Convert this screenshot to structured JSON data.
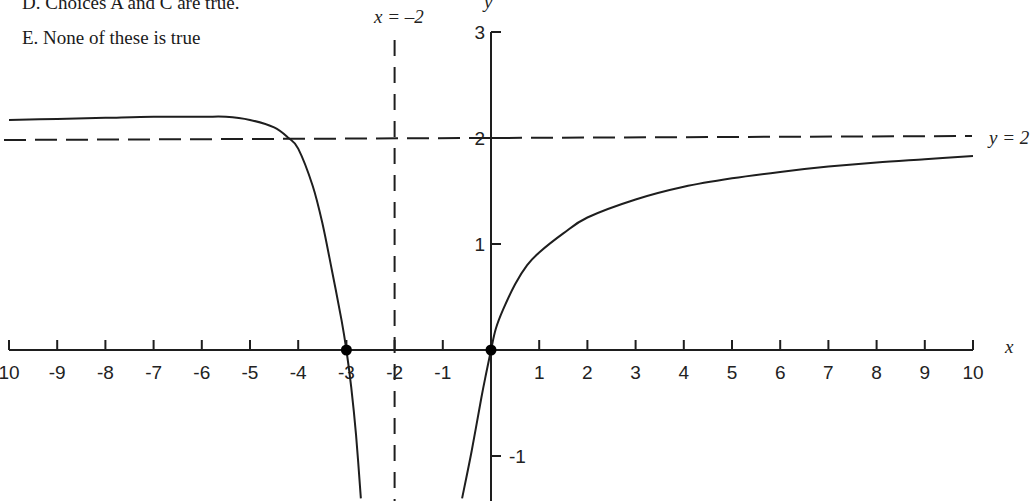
{
  "question": {
    "choices": [
      {
        "id": "D",
        "text": "D. Choices A and C are true."
      },
      {
        "id": "E",
        "text": "E. None of these is true"
      }
    ]
  },
  "chart_data": {
    "type": "line",
    "title": "",
    "xlabel": "x",
    "ylabel": "y",
    "xlim": [
      -10,
      10
    ],
    "ylim": [
      -1.4,
      3
    ],
    "grid": false,
    "x_ticks": [
      -10,
      -9,
      -8,
      -7,
      -6,
      -5,
      -4,
      -3,
      -2,
      -1,
      1,
      2,
      3,
      4,
      5,
      6,
      7,
      8,
      9,
      10
    ],
    "x_tick_labels": [
      "10",
      "-9",
      "-8",
      "-7",
      "-6",
      "-5",
      "-4",
      "-3",
      "-2",
      "-1",
      "1",
      "2",
      "3",
      "4",
      "5",
      "6",
      "7",
      "8",
      "9",
      "10"
    ],
    "y_ticks": [
      3,
      2,
      1,
      -1
    ],
    "y_tick_labels": [
      "3",
      "2",
      "1",
      "-1"
    ],
    "asymptotes": [
      {
        "type": "vertical",
        "value": -2,
        "label": "x = –2",
        "style": "dashed"
      },
      {
        "type": "horizontal",
        "value": 2,
        "label": "y = 2",
        "style": "dashed"
      }
    ],
    "points": [
      {
        "x": -3,
        "y": 0,
        "marker": "filled-dot"
      },
      {
        "x": 0,
        "y": 0,
        "marker": "filled-dot"
      }
    ],
    "series": [
      {
        "name": "left branch (x < -2)",
        "x": [
          -10,
          -9,
          -8,
          -7,
          -6,
          -5.5,
          -5,
          -4.5,
          -4.2,
          -4,
          -3.7,
          -3.5,
          -3.3,
          -3.1,
          -3,
          -2.9,
          -2.8,
          -2.7
        ],
        "y": [
          2.17,
          2.18,
          2.19,
          2.2,
          2.2,
          2.2,
          2.17,
          2.1,
          2.0,
          1.9,
          1.55,
          1.2,
          0.75,
          0.28,
          0.0,
          -0.35,
          -0.8,
          -1.4
        ]
      },
      {
        "name": "right branch (x > -2)",
        "x": [
          -0.6,
          -0.4,
          -0.2,
          -0.1,
          0,
          0.1,
          0.25,
          0.5,
          0.75,
          1,
          1.5,
          2,
          3,
          4,
          5,
          6,
          7,
          8,
          9,
          10
        ],
        "y": [
          -1.4,
          -0.95,
          -0.45,
          -0.22,
          0.0,
          0.2,
          0.38,
          0.62,
          0.8,
          0.92,
          1.1,
          1.25,
          1.42,
          1.54,
          1.62,
          1.68,
          1.73,
          1.77,
          1.8,
          1.83
        ]
      }
    ]
  },
  "labels": {
    "x_axis": "x",
    "y_axis": "y",
    "vertical_asymptote": "x = –2",
    "horizontal_asymptote": "y = 2"
  }
}
